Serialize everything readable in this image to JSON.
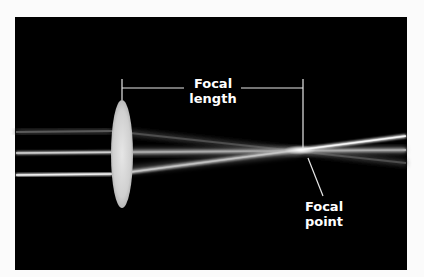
{
  "diagram": {
    "labels": {
      "focal_length_line1": "Focal",
      "focal_length_line2": "length",
      "focal_point_line1": "Focal",
      "focal_point_line2": "point"
    },
    "colors": {
      "background": "#000000",
      "frame": "#fbfbfb",
      "lens": "#d9d9d9",
      "ray": "#e8e8e8",
      "ray_dim": "#555555",
      "label": "#ffffff"
    },
    "elements": {
      "lens": "convex-lens",
      "rays": [
        "upper-ray",
        "center-ray",
        "lower-ray"
      ],
      "focal_point": {
        "x": 303,
        "y": 150
      }
    }
  }
}
